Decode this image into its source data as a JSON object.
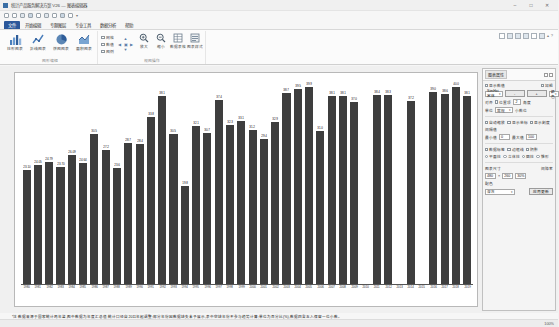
{
  "window": {
    "title": "统计产品服务解决方案 V26 — 图表编辑器",
    "minimize_label": "–",
    "maximize_label": "□",
    "close_label": "✕"
  },
  "quick_access": {
    "items": [
      {
        "name": "save-icon",
        "label": "保存"
      },
      {
        "name": "open-icon",
        "label": "打开"
      },
      {
        "name": "print-icon",
        "label": "打印"
      },
      {
        "name": "print-preview-icon",
        "label": "打印预览"
      },
      {
        "name": "undo-icon",
        "label": "撤销"
      },
      {
        "name": "redo-icon",
        "label": "恢复"
      },
      {
        "name": "copy-icon",
        "label": "复制"
      },
      {
        "name": "chart-icon",
        "label": "图表"
      },
      {
        "name": "export-icon",
        "label": "导出"
      }
    ],
    "more_label": "▾"
  },
  "ribbon": {
    "tabs": [
      {
        "label": "文件",
        "active": true
      },
      {
        "label": "开始编辑",
        "active": false
      },
      {
        "label": "专题图层",
        "active": false
      },
      {
        "label": "专业工具",
        "active": false
      },
      {
        "label": "数据分析",
        "active": false
      },
      {
        "label": "帮助",
        "active": false
      }
    ],
    "groups": [
      {
        "label": "图形编辑",
        "buttons": [
          {
            "name": "bar-chart-button",
            "icon": "bar-chart-icon",
            "label": "柱形图表"
          },
          {
            "name": "line-chart-button",
            "icon": "line-chart-icon",
            "label": "折线图表"
          },
          {
            "name": "pie-chart-button",
            "icon": "pie-chart-icon",
            "label": "饼图图表"
          },
          {
            "name": "area-chart-button",
            "icon": "area-chart-icon",
            "label": "面积图表"
          }
        ]
      },
      {
        "label": "视图操作",
        "checkboxes": [
          {
            "name": "show-grid-checkbox",
            "label": "网格",
            "checked": false
          },
          {
            "name": "show-labels-checkbox",
            "label": "数值",
            "checked": false
          },
          {
            "name": "show-legend-checkbox",
            "label": "图例",
            "checked": false
          }
        ],
        "pan_label": "平移",
        "zoom_buttons": [
          {
            "name": "zoom-in-button",
            "icon": "zoom-in-icon",
            "label": "放大"
          },
          {
            "name": "zoom-out-button",
            "icon": "zoom-out-icon",
            "label": "缩小"
          }
        ],
        "small_buttons": [
          {
            "name": "data-table-button",
            "icon": "table-icon",
            "label": "数据表格"
          },
          {
            "name": "chart-style-button",
            "icon": "style-icon",
            "label": "图表样式"
          }
        ]
      }
    ],
    "right_tools": {
      "icons": [
        "frame-icon",
        "align-left-icon",
        "align-center-icon",
        "align-right-icon",
        "distribute-icon",
        "layer-icon"
      ],
      "collapse_label": "▴",
      "help_label": "?"
    }
  },
  "chart_data": {
    "type": "bar",
    "title": "",
    "xlabel": "",
    "ylabel": "",
    "ylim": [
      0,
      100
    ],
    "grid": false,
    "legend": "none",
    "bar_color": "#3e3e3e",
    "categories": [
      "1980",
      "1981",
      "1982",
      "1983",
      "1984",
      "1985",
      "1986",
      "1987",
      "1988",
      "1989",
      "1990",
      "1991",
      "1992",
      "1993",
      "1994",
      "1995",
      "1996",
      "1997",
      "1998",
      "1999",
      "2000",
      "2001",
      "2002",
      "2003",
      "2004",
      "2005",
      "2006",
      "2007",
      "2008",
      "2009",
      "2010",
      "2011",
      "2012",
      "2013",
      "2014",
      "2015",
      "2016",
      "2017",
      "2018",
      "2019"
    ],
    "values": [
      23.1,
      24.05,
      24.79,
      23.7,
      26.09,
      24.64,
      30.5,
      27.2,
      23.6,
      28.7,
      28.4,
      33.8,
      38.1,
      30.5,
      19.8,
      32.1,
      30.7,
      37.4,
      32.3,
      33.1,
      31.2,
      29.4,
      32.9,
      38.7,
      39.5,
      39.9,
      31.0,
      38.1,
      38.1,
      37.0,
      null,
      38.4,
      38.3,
      null,
      37.2,
      null,
      39.0,
      38.6,
      40.0,
      38.1
    ],
    "value_labels": [
      "23.10",
      "24.05",
      "24.79",
      "23.70",
      "26.09",
      "24.64",
      "30.5",
      "27.2",
      "23.6",
      "28.7",
      "28.4",
      "33.8",
      "38.1",
      "30.5",
      "19.8",
      "32.1",
      "30.7",
      "37.4",
      "32.3",
      "33.1",
      "31.2",
      "29.4",
      "32.9",
      "38.7",
      "39.5",
      "39.9",
      "31.0",
      "38.1",
      "38.1",
      "37.0",
      "",
      "38.4",
      "38.3",
      "",
      "37.2",
      "",
      "39.0",
      "38.6",
      "40.0",
      "38.1"
    ]
  },
  "panel": {
    "title": "图表属性",
    "pin_label": "⚲",
    "close_label": "✕",
    "sections": {
      "display": {
        "show_value_label": "显示数值",
        "bold_label": "加粗",
        "font_value": "SimHei 宋体",
        "font_size_value": "9",
        "minus_label": "-",
        "plus_label": "+",
        "color_label": "颜色",
        "align_label": "对齐",
        "position_label": "位置顶",
        "angle_label": "角度",
        "unit_label": "单位",
        "format_value": "常规",
        "decimal_label": "小数位",
        "decimal_value": "2"
      },
      "axis": {
        "auto_scale_label": "自动缩放",
        "show_axis_label": "显示坐标",
        "show_tick_label": "显示刻度",
        "interval_label": "间隔值",
        "min_label": "最小值",
        "min_value": "0",
        "max_label": "最大值",
        "max_value": "100"
      },
      "series": {
        "data_label_label": "数据标签",
        "border_label": "边框线",
        "shadow_label": "阴影",
        "style_label": "样式:",
        "style_options": [
          "平面柱",
          "立体柱",
          "圆柱",
          "锥形"
        ],
        "style_selected": "平面柱"
      },
      "size": {
        "size_label": "图表尺寸",
        "width_value": "480",
        "x_label": "×",
        "height_value": "260",
        "gap_label": "间隙率",
        "gap_value": "30%"
      },
      "theme": {
        "theme_label": "配色",
        "theme_value": "深灰",
        "apply_label": "应用更新"
      }
    }
  },
  "footnote": {
    "text": "*注:数据来源于国家统计局年鉴,图中数据为年度汇总值;统计口径自2011年起调整;部分年份因数据缺失未予展示,表中空缺年份不参与趋势计算;单位为百分比(%),数据四舍五入保留一位小数。"
  },
  "statusbar": {
    "ready_label": "就绪",
    "zoom_label": "100%"
  }
}
